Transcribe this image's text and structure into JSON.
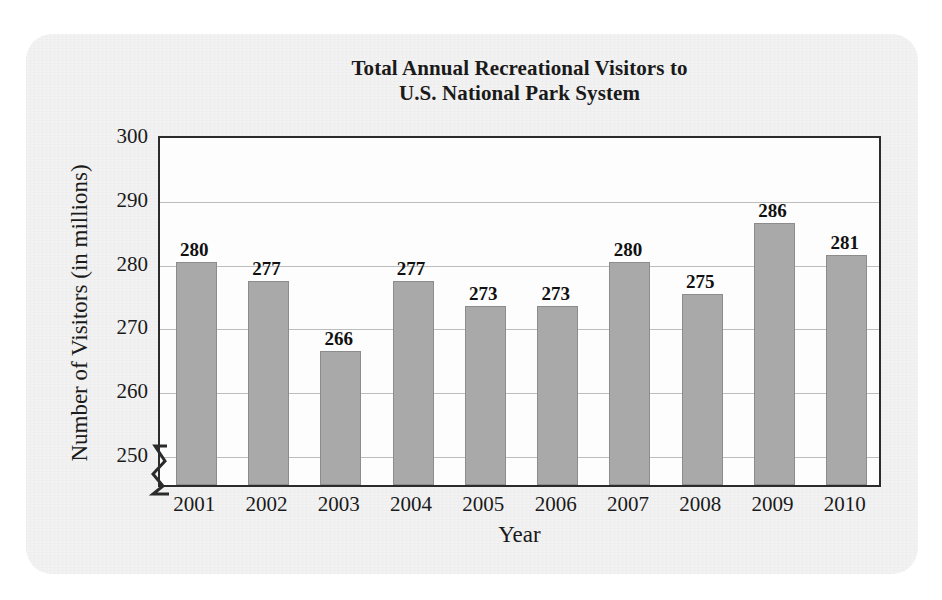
{
  "chart_data": {
    "type": "bar",
    "title": "Total Annual Recreational Visitors to U.S. National Park System",
    "title_line1": "Total Annual Recreational Visitors to",
    "title_line2": "U.S. National Park System",
    "xlabel": "Year",
    "ylabel": "Number of Visitors (in millions)",
    "categories": [
      "2001",
      "2002",
      "2003",
      "2004",
      "2005",
      "2006",
      "2007",
      "2008",
      "2009",
      "2010"
    ],
    "values": [
      280,
      277,
      266,
      277,
      273,
      273,
      280,
      275,
      286,
      281
    ],
    "ylim": [
      245,
      300
    ],
    "yticks": [
      250,
      260,
      270,
      280,
      290,
      300
    ],
    "ytick_labels": [
      "250",
      "260",
      "270",
      "280",
      "290",
      "300"
    ],
    "grid": true,
    "legend": "none",
    "axis_break": true,
    "bar_color": "#a9a9a9",
    "bar_edge_color": "#8c8c8c",
    "grid_color": "#bdbdbd",
    "frame_color": "#2b2b2b",
    "text_color": "#1a1a1a",
    "paper_color": "#f2f2f2"
  }
}
